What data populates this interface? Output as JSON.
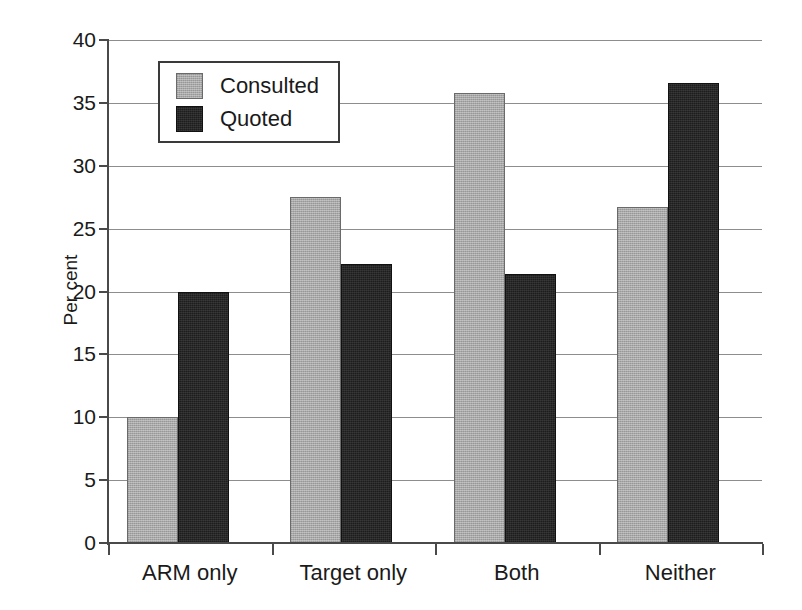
{
  "chart_data": {
    "type": "bar",
    "title": "",
    "subtitle": "",
    "xlabel": "",
    "ylabel": "Per cent",
    "categories": [
      "ARM only",
      "Target only",
      "Both",
      "Neither"
    ],
    "series": [
      {
        "name": "Consulted",
        "color": "#a8a8a8",
        "values": [
          10.0,
          27.5,
          35.8,
          26.7
        ]
      },
      {
        "name": "Quoted",
        "color": "#1d1d1d",
        "values": [
          20.0,
          22.2,
          21.4,
          36.6
        ]
      }
    ],
    "ylim": [
      0,
      40
    ],
    "yticks": [
      0,
      5,
      10,
      15,
      20,
      25,
      30,
      35,
      40
    ],
    "ytick_labels": [
      "0",
      "5",
      "10",
      "15",
      "20",
      "25",
      "30",
      "35",
      "40"
    ],
    "grid": true,
    "grid_axis": "y",
    "legend": {
      "position": "upper-left-inside",
      "entries": [
        "Consulted",
        "Quoted"
      ]
    }
  }
}
